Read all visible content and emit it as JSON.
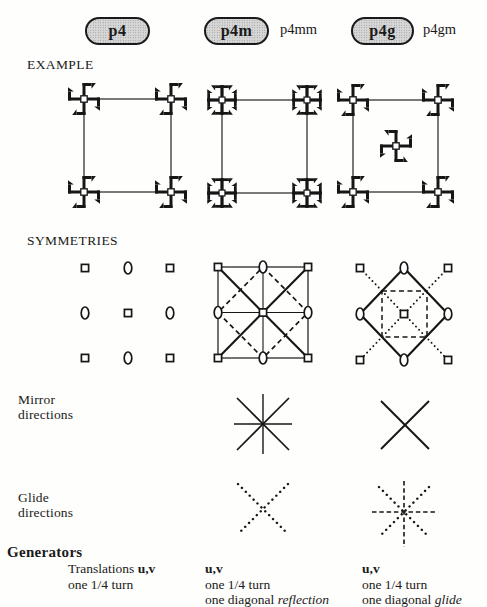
{
  "colors": {
    "ink": "#1a1a1a",
    "badge_fill": "#d6d6d6",
    "badge_border": "#1a1a1a",
    "paper": "#fefefc"
  },
  "header": {
    "badges": [
      {
        "label": "p4"
      },
      {
        "label": "p4m",
        "alt_label": "p4mm"
      },
      {
        "label": "p4g",
        "alt_label": "p4gm"
      }
    ]
  },
  "row_labels": {
    "example": "EXAMPLE",
    "symmetries": "SYMMETRIES",
    "mirror_line1": "Mirror",
    "mirror_line2": "directions",
    "glide_line1": "Glide",
    "glide_line2": "directions"
  },
  "generators": {
    "heading": "Generators",
    "p4": {
      "line1_prefix": "Translations ",
      "line1_bold": "u,v",
      "line2": "one 1/4 turn"
    },
    "p4m": {
      "line1_bold": "u,v",
      "line2": "one 1/4 turn",
      "line3_prefix": "one diagonal ",
      "line3_italic": "reflection"
    },
    "p4g": {
      "line1_bold": "u,v",
      "line2": "one 1/4 turn",
      "line3_prefix": "one diagonal ",
      "line3_italic": "glide"
    }
  }
}
